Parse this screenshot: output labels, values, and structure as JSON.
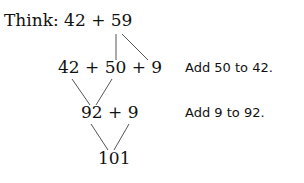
{
  "diagram": {
    "think_label": "Think: 42 + 59",
    "step1_expr": "42 + 50 + 9",
    "step1_note": "Add 50 to 42.",
    "step2_expr": "92 + 9",
    "step2_note": "Add 9 to 92.",
    "result": "101"
  }
}
